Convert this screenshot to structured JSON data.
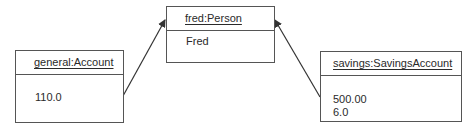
{
  "diagram": {
    "type": "uml-object-diagram",
    "objects": [
      {
        "id": "general",
        "name": "general:Account",
        "values": [
          "110.0"
        ]
      },
      {
        "id": "fred",
        "name": "fred:Person",
        "values": [
          "Fred"
        ]
      },
      {
        "id": "savings",
        "name": "savings:SavingsAccount",
        "values": [
          "500.00",
          "6.0"
        ]
      }
    ],
    "links": [
      {
        "from": "general",
        "to": "fred",
        "arrow": "open-head"
      },
      {
        "from": "savings",
        "to": "fred",
        "arrow": "open-head"
      }
    ]
  }
}
